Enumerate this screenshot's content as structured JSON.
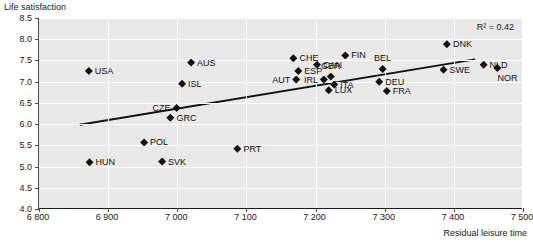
{
  "chart_data": {
    "type": "scatter",
    "title": "",
    "ylabel": "Life satisfaction",
    "xlabel": "Residual leisure time",
    "xlim": [
      6800,
      7500
    ],
    "ylim": [
      4.0,
      8.5
    ],
    "grid": true,
    "legend": null,
    "annotation": "R² = 0.42",
    "r_squared": 0.42,
    "x_ticks": [
      "6 800",
      "6 900",
      "7 000",
      "7 100",
      "7 200",
      "7 300",
      "7 400",
      "7 500"
    ],
    "x_tick_values": [
      6800,
      6900,
      7000,
      7100,
      7200,
      7300,
      7400,
      7500
    ],
    "y_ticks": [
      "4.0",
      "4.5",
      "5.0",
      "5.5",
      "6.0",
      "6.5",
      "7.0",
      "7.5",
      "8.0",
      "8.5"
    ],
    "y_tick_values": [
      4.0,
      4.5,
      5.0,
      5.5,
      6.0,
      6.5,
      7.0,
      7.5,
      8.0,
      8.5
    ],
    "trendline": {
      "x_start": 6859,
      "y_start": 5.97,
      "x_end": 7432,
      "y_end": 7.52
    },
    "points": [
      {
        "label": "USA",
        "x": 6872,
        "y": 7.25,
        "label_pos": "right"
      },
      {
        "label": "HUN",
        "x": 6873,
        "y": 5.1,
        "label_pos": "right"
      },
      {
        "label": "POL",
        "x": 6952,
        "y": 5.57,
        "label_pos": "right"
      },
      {
        "label": "SVK",
        "x": 6978,
        "y": 5.12,
        "label_pos": "right"
      },
      {
        "label": "GRC",
        "x": 6990,
        "y": 6.15,
        "label_pos": "right"
      },
      {
        "label": "CZE",
        "x": 6999,
        "y": 6.38,
        "label_pos": "left"
      },
      {
        "label": "ISL",
        "x": 7007,
        "y": 6.95,
        "label_pos": "right"
      },
      {
        "label": "AUS",
        "x": 7020,
        "y": 7.45,
        "label_pos": "right"
      },
      {
        "label": "PRT",
        "x": 7087,
        "y": 5.42,
        "label_pos": "right"
      },
      {
        "label": "AUT",
        "x": 7172,
        "y": 7.05,
        "label_pos": "left"
      },
      {
        "label": "ESP",
        "x": 7175,
        "y": 7.25,
        "label_pos": "right"
      },
      {
        "label": "CHE",
        "x": 7168,
        "y": 7.55,
        "label_pos": "right"
      },
      {
        "label": "CAN",
        "x": 7202,
        "y": 7.4,
        "label_pos": "right"
      },
      {
        "label": "IRL",
        "x": 7212,
        "y": 7.05,
        "label_pos": "left"
      },
      {
        "label": "GBR",
        "x": 7222,
        "y": 7.12,
        "label_pos": "above"
      },
      {
        "label": "ITA",
        "x": 7227,
        "y": 6.93,
        "label_pos": "right"
      },
      {
        "label": "LUX",
        "x": 7219,
        "y": 6.8,
        "label_pos": "right"
      },
      {
        "label": "FIN",
        "x": 7243,
        "y": 7.62,
        "label_pos": "right"
      },
      {
        "label": "BEL",
        "x": 7297,
        "y": 7.3,
        "label_pos": "above"
      },
      {
        "label": "DEU",
        "x": 7292,
        "y": 7.0,
        "label_pos": "right"
      },
      {
        "label": "FRA",
        "x": 7303,
        "y": 6.78,
        "label_pos": "right"
      },
      {
        "label": "SWE",
        "x": 7385,
        "y": 7.28,
        "label_pos": "right"
      },
      {
        "label": "DNK",
        "x": 7390,
        "y": 7.88,
        "label_pos": "right"
      },
      {
        "label": "NLD",
        "x": 7443,
        "y": 7.4,
        "label_pos": "right"
      },
      {
        "label": "NOR",
        "x": 7463,
        "y": 7.32,
        "label_pos": "below-right"
      }
    ]
  }
}
